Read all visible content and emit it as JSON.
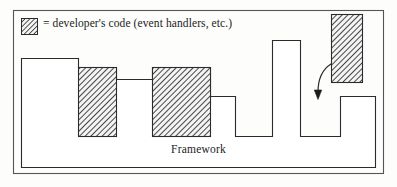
{
  "figure": {
    "legend": {
      "swatch_name": "hatched-square-swatch",
      "text": "= developer's code (event handlers, etc.)"
    },
    "framework_label": "Framework",
    "colors": {
      "stroke": "#2b2b2b",
      "hatch": "#4a4a4a",
      "hatch_fill": "#f2f2f2",
      "background": "#fdfdfc",
      "outer_border": "#555555"
    },
    "outer_border": {
      "x": 13,
      "y": 10,
      "width": 371,
      "height": 164
    },
    "legend_swatch": {
      "x": 21,
      "y": 18,
      "width": 17,
      "height": 17
    },
    "framework_outline_path": "M 21 58 L 78 58 L 78 67 L 116 67 L 116 79 L 152 79 L 152 67 L 210 67 L 210 96 L 235 96 L 235 136 L 272 136 L 272 40 L 300 40 L 300 136 L 340 136 L 340 96 L 375 96 L 375 167 L 21 167 Z",
    "developer_boxes": [
      {
        "name": "developer-box-left",
        "x": 78,
        "y": 67,
        "width": 38,
        "height": 69
      },
      {
        "name": "developer-box-middle",
        "x": 152,
        "y": 67,
        "width": 58,
        "height": 69
      },
      {
        "name": "developer-box-right",
        "x": 331,
        "y": 14,
        "width": 31,
        "height": 68
      }
    ],
    "connector_line": {
      "x1": 116,
      "y1": 79,
      "x2": 152,
      "y2": 79
    },
    "callback_arrow": {
      "name": "callback-arrow",
      "path": "M 331 64 C 322 70, 318 80, 318 93",
      "tip_x": 318,
      "tip_y": 99
    }
  }
}
